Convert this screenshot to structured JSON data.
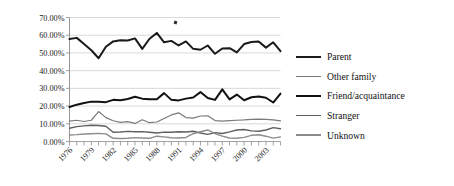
{
  "chart_data": {
    "type": "line",
    "title": "",
    "subtitle": "",
    "xlabel": "",
    "ylabel": "",
    "grid": true,
    "legend_position": "right",
    "ylim": [
      0,
      70
    ],
    "ytick_labels": [
      "0.00%",
      "10.00%",
      "20.00%",
      "30.00%",
      "40.00%",
      "50.00%",
      "60.00%",
      "70.00%"
    ],
    "ytick_values": [
      0,
      10,
      20,
      30,
      40,
      50,
      60,
      70
    ],
    "x": [
      1976,
      1977,
      1978,
      1979,
      1980,
      1981,
      1982,
      1983,
      1984,
      1985,
      1986,
      1987,
      1988,
      1989,
      1990,
      1991,
      1992,
      1993,
      1994,
      1995,
      1996,
      1997,
      1998,
      1999,
      2000,
      2001,
      2002,
      2003,
      2004,
      2005
    ],
    "xtick_labels": [
      "1976",
      "1979",
      "1982",
      "1985",
      "1988",
      "1991",
      "1994",
      "1997",
      "2000",
      "2003"
    ],
    "xtick_values": [
      1976,
      1979,
      1982,
      1985,
      1988,
      1991,
      1994,
      1997,
      2000,
      2003
    ],
    "xlim": [
      1976,
      2005
    ],
    "series": [
      {
        "name": "Parent",
        "color": "#1a1a1a",
        "width": 2.0,
        "values": [
          57.8,
          58.5,
          55.0,
          51.5,
          47.0,
          53.5,
          56.5,
          57.2,
          57.0,
          58.2,
          52.3,
          58.0,
          61.3,
          56.0,
          56.8,
          54.2,
          56.5,
          52.3,
          51.8,
          54.2,
          49.5,
          52.5,
          52.7,
          50.3,
          55.0,
          56.2,
          56.4,
          53.0,
          56.0,
          51.0
        ]
      },
      {
        "name": "Other family",
        "color": "#7a7a7a",
        "width": 1.2,
        "values": [
          11.5,
          12.0,
          11.3,
          12.0,
          16.9,
          13.5,
          11.7,
          10.8,
          11.2,
          10.2,
          12.3,
          10.6,
          11.0,
          13.0,
          15.0,
          16.2,
          13.5,
          13.2,
          14.4,
          14.5,
          11.8,
          11.5,
          11.8,
          12.0,
          12.2,
          12.5,
          12.6,
          12.5,
          12.2,
          11.6
        ]
      },
      {
        "name": "Friend/acquaintance",
        "color": "#111111",
        "width": 2.0,
        "values": [
          19.5,
          20.8,
          21.7,
          22.5,
          22.4,
          22.2,
          23.5,
          23.3,
          24.0,
          25.3,
          24.2,
          23.8,
          23.9,
          27.3,
          23.5,
          23.2,
          24.2,
          24.8,
          27.9,
          24.6,
          23.5,
          29.4,
          23.8,
          26.5,
          23.3,
          25.0,
          25.4,
          24.7,
          22.0,
          27.0
        ]
      },
      {
        "name": "Stranger",
        "color": "#5f5f5f",
        "width": 1.4,
        "values": [
          7.5,
          8.4,
          8.8,
          9.2,
          9.0,
          8.6,
          5.2,
          5.4,
          5.7,
          5.5,
          5.6,
          5.2,
          4.8,
          5.3,
          5.2,
          5.5,
          5.4,
          5.8,
          4.8,
          4.0,
          5.0,
          4.5,
          5.4,
          6.5,
          6.8,
          6.0,
          5.8,
          6.5,
          7.8,
          7.2
        ]
      },
      {
        "name": "Unknown",
        "color": "#8c8c8c",
        "width": 1.4,
        "values": [
          3.7,
          3.9,
          4.2,
          4.4,
          4.6,
          4.3,
          1.8,
          1.7,
          1.8,
          2.2,
          2.0,
          1.8,
          3.0,
          2.6,
          2.1,
          2.0,
          2.3,
          4.4,
          5.5,
          6.5,
          4.5,
          3.0,
          2.0,
          1.8,
          2.3,
          3.5,
          3.8,
          3.0,
          1.9,
          2.6
        ]
      }
    ]
  },
  "legend": {
    "items": [
      {
        "label": "Parent"
      },
      {
        "label": "Other family"
      },
      {
        "label": "Friend/acquaintance"
      },
      {
        "label": "Stranger"
      },
      {
        "label": "Unknown"
      }
    ]
  }
}
